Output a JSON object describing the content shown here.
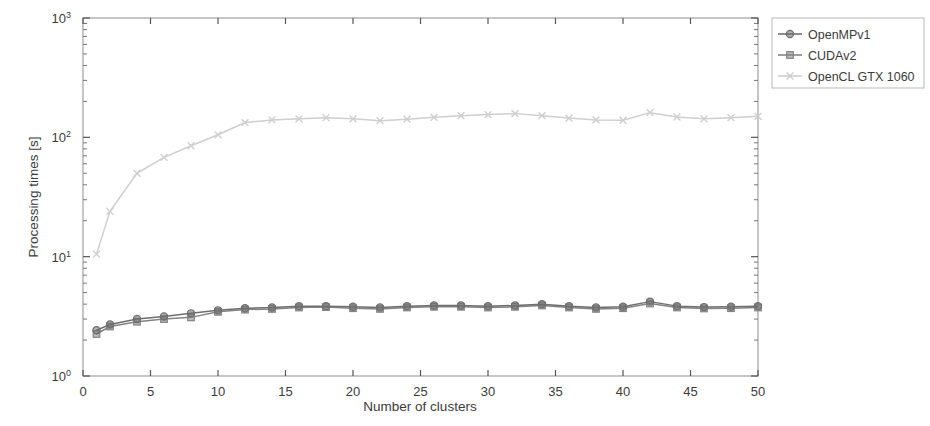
{
  "chart_data": {
    "type": "line",
    "title": "",
    "xlabel": "Number of clusters",
    "ylabel": "Processing times [s]",
    "yscale": "log",
    "xscale": "linear",
    "xlim": [
      0,
      50
    ],
    "ylim": [
      1,
      1000
    ],
    "xticks": [
      0,
      5,
      10,
      15,
      20,
      25,
      30,
      35,
      40,
      45,
      50
    ],
    "xtick_labels": [
      "0",
      "5",
      "10",
      "15",
      "20",
      "25",
      "30",
      "35",
      "40",
      "45",
      "50"
    ],
    "yticks": [
      1,
      10,
      100,
      1000
    ],
    "ytick_labels": [
      "10^0",
      "10^1",
      "10^2",
      "10^3"
    ],
    "grid": false,
    "legend_position": "outside-top-right",
    "x": [
      1,
      2,
      4,
      6,
      8,
      10,
      12,
      14,
      16,
      18,
      20,
      22,
      24,
      26,
      28,
      30,
      32,
      34,
      36,
      38,
      40,
      42,
      44,
      46,
      48,
      50
    ],
    "series": [
      {
        "name": "OpenMPv1",
        "color": "#6e6e6e",
        "marker": "circle",
        "values": [
          2.42,
          2.7,
          3.0,
          3.15,
          3.35,
          3.55,
          3.7,
          3.75,
          3.85,
          3.85,
          3.8,
          3.75,
          3.85,
          3.9,
          3.9,
          3.85,
          3.9,
          4.0,
          3.85,
          3.75,
          3.8,
          4.2,
          3.85,
          3.78,
          3.8,
          3.85
        ]
      },
      {
        "name": "CUDAv2",
        "color": "#848484",
        "marker": "square",
        "values": [
          2.25,
          2.6,
          2.85,
          3.0,
          3.1,
          3.45,
          3.6,
          3.65,
          3.75,
          3.78,
          3.7,
          3.65,
          3.75,
          3.8,
          3.8,
          3.75,
          3.8,
          3.9,
          3.75,
          3.65,
          3.7,
          4.05,
          3.75,
          3.68,
          3.7,
          3.75
        ]
      },
      {
        "name": "OpenCL GTX 1060",
        "color": "#cfcfcf",
        "marker": "cross",
        "values": [
          10.5,
          24.0,
          50.0,
          68.0,
          85.0,
          105.0,
          133.0,
          140.0,
          143.0,
          146.0,
          143.0,
          138.0,
          142.0,
          147.0,
          152.0,
          155.0,
          158.0,
          152.0,
          145.0,
          140.0,
          139.0,
          161.0,
          148.0,
          143.0,
          146.0,
          150.0
        ]
      }
    ]
  },
  "legend": {
    "items": [
      {
        "label": "OpenMPv1"
      },
      {
        "label": "CUDAv2"
      },
      {
        "label": "OpenCL GTX 1060"
      }
    ]
  },
  "axes": {
    "x_title": "Number of clusters",
    "y_title": "Processing times [s]",
    "y_exponents": [
      "0",
      "1",
      "2",
      "3"
    ],
    "y_base": "10"
  }
}
